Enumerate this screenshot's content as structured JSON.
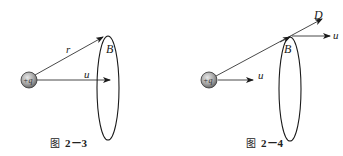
{
  "figures": [
    {
      "id": "fig-2-3",
      "caption": {
        "prefix": "图",
        "number": "2－3"
      },
      "charge": {
        "label": "+q"
      },
      "labels": {
        "r": "r",
        "u": "u",
        "B": "B"
      }
    },
    {
      "id": "fig-2-4",
      "caption": {
        "prefix": "图",
        "number": "2－4"
      },
      "charge": {
        "label": "+q"
      },
      "labels": {
        "D": "D",
        "u_charge": "u",
        "u_loop": "u",
        "B": "B"
      }
    }
  ],
  "colors": {
    "stroke": "#1a1a1a",
    "charge_fill": "#a8a8a8",
    "background": "#ffffff"
  }
}
